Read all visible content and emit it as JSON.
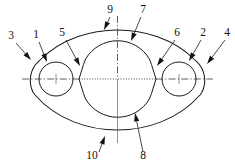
{
  "drawing": {
    "title": "Flange gasket part outline",
    "view": "front-view",
    "line_color": "#1a1a1a",
    "background_color": "#ffffff",
    "centerline_color": "#2b2b2b"
  },
  "geometry": {
    "center": {
      "x": 117.5,
      "y": 79
    },
    "outer_body": {
      "left_lobe_center": {
        "x": 56,
        "y": 79
      },
      "right_lobe_center": {
        "x": 179,
        "y": 79
      },
      "lobe_outer_radius": 26,
      "top_peak_y": 30,
      "bottom_peak_y": 130
    },
    "bolt_holes": [
      {
        "name": "left-hole",
        "cx": 56,
        "cy": 79,
        "r": 17
      },
      {
        "name": "right-hole",
        "cx": 179,
        "cy": 79,
        "r": 17
      }
    ],
    "central_bore": {
      "cx": 117.5,
      "cy": 79,
      "r": 37
    },
    "notches": [
      {
        "name": "left-notch",
        "apex_x": 79,
        "apex_y": 79
      },
      {
        "name": "right-notch",
        "apex_x": 156,
        "apex_y": 79
      }
    ],
    "centerlines": {
      "horizontal": {
        "x1": 22,
        "x2": 213,
        "y": 79
      },
      "vertical": {
        "x": 117.5,
        "y1": 16,
        "y2": 143
      }
    }
  },
  "callouts": [
    {
      "id": "3",
      "label": "3",
      "text_x": 11,
      "text_y": 39,
      "line": {
        "x1": 16,
        "y1": 43,
        "x2": 31,
        "y2": 60
      },
      "arrow_angle": 48
    },
    {
      "id": "1",
      "label": "1",
      "text_x": 36,
      "text_y": 38,
      "line": {
        "x1": 39,
        "y1": 42,
        "x2": 47,
        "y2": 62
      },
      "arrow_angle": 68
    },
    {
      "id": "5",
      "label": "5",
      "text_x": 62,
      "text_y": 36,
      "line": {
        "x1": 66,
        "y1": 40,
        "x2": 80,
        "y2": 66
      },
      "arrow_angle": 62
    },
    {
      "id": "9",
      "label": "9",
      "text_x": 110,
      "text_y": 13,
      "line": {
        "x1": 110,
        "y1": 17,
        "x2": 104,
        "y2": 30
      },
      "arrow_angle": 115
    },
    {
      "id": "7",
      "label": "7",
      "text_x": 143,
      "text_y": 13,
      "line": {
        "x1": 141,
        "y1": 17,
        "x2": 131,
        "y2": 41
      },
      "arrow_angle": 113
    },
    {
      "id": "6",
      "label": "6",
      "text_x": 177,
      "text_y": 36,
      "line": {
        "x1": 175,
        "y1": 40,
        "x2": 157,
        "y2": 66
      },
      "arrow_angle": 125
    },
    {
      "id": "2",
      "label": "2",
      "text_x": 203,
      "text_y": 36,
      "line": {
        "x1": 201,
        "y1": 40,
        "x2": 189,
        "y2": 61
      },
      "arrow_angle": 120
    },
    {
      "id": "4",
      "label": "4",
      "text_x": 227,
      "text_y": 36,
      "line": {
        "x1": 225,
        "y1": 40,
        "x2": 207,
        "y2": 64
      },
      "arrow_angle": 127
    },
    {
      "id": "10",
      "label": "10",
      "text_x": 92,
      "text_y": 159,
      "line": {
        "x1": 99,
        "y1": 152,
        "x2": 105,
        "y2": 136
      },
      "arrow_angle": -69
    },
    {
      "id": "8",
      "label": "8",
      "text_x": 143,
      "text_y": 159,
      "line": {
        "x1": 143,
        "y1": 152,
        "x2": 135,
        "y2": 113
      },
      "arrow_angle": -102
    }
  ]
}
